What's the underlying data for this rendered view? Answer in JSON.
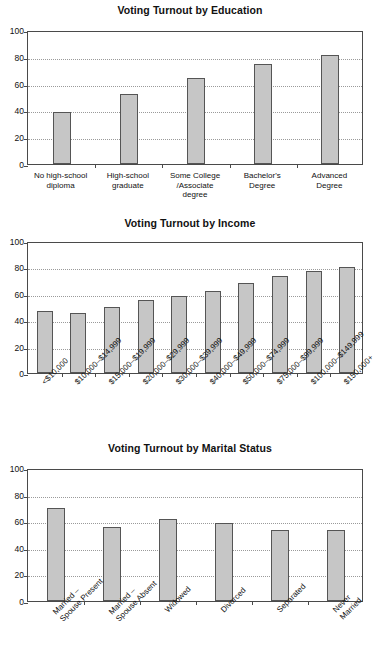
{
  "document": {
    "kind": "statistical-figure-sheet",
    "background_color": "#ffffff"
  },
  "style": {
    "bar_fill": "#c6c6c6",
    "bar_stroke": "#555555",
    "axis_color": "#4a4a4a",
    "grid_color": "#9a9a9a",
    "text_color": "#111111"
  },
  "charts": [
    {
      "id": "education",
      "title": "Voting Turnout by Education",
      "y_ticks": [
        "0",
        "20",
        "40",
        "60",
        "80",
        "100"
      ],
      "categories": [
        "No high-school\ndiploma",
        "High-school\ngraduate",
        "Some College\n/Associate\ndegree",
        "Bachelor's\nDegree",
        "Advanced\nDegree"
      ],
      "values": [
        38.5,
        52.5,
        64,
        75,
        81.5
      ],
      "label_rotation": 0
    },
    {
      "id": "income",
      "title": "Voting Turnout by Income",
      "y_ticks": [
        "0",
        "20",
        "40",
        "60",
        "80",
        "100"
      ],
      "categories": [
        "<$10,000",
        "$10,000–$14,999",
        "$15,000–$19,999",
        "$20,000–$29,999",
        "$30,000–$39,999",
        "$40,000–$49,999",
        "$50,000–$74,999",
        "$75,000–$99,999",
        "$100,000–$149,999",
        "$150,000+"
      ],
      "values": [
        47,
        45.5,
        50,
        55.5,
        58,
        62.5,
        68,
        73.5,
        77,
        80
      ],
      "label_rotation": -45
    },
    {
      "id": "marital-status",
      "title": "Voting Turnout by Marital Status",
      "y_ticks": [
        "0",
        "20",
        "40",
        "60",
        "80",
        "100"
      ],
      "categories": [
        "Married –\nSpouse Present",
        "Married –\nSpouse Absent",
        "Widowed",
        "Divorced",
        "Separated",
        "Never Married"
      ],
      "values": [
        70,
        56,
        61.5,
        59,
        53.5,
        53.5
      ],
      "label_rotation": -45
    }
  ],
  "chart_data": [
    {
      "type": "bar",
      "title": "Voting Turnout by Education",
      "xlabel": "",
      "ylabel": "",
      "ylim": [
        0,
        100
      ],
      "grid": true,
      "legend": "none",
      "categories": [
        "No high-school diploma",
        "High-school graduate",
        "Some College/Associate degree",
        "Bachelor's Degree",
        "Advanced Degree"
      ],
      "values": [
        38.5,
        52.5,
        64,
        75,
        81.5
      ],
      "ytick_labels": [
        "0",
        "20",
        "40",
        "60",
        "80",
        "100"
      ]
    },
    {
      "type": "bar",
      "title": "Voting Turnout by Income",
      "xlabel": "",
      "ylabel": "",
      "ylim": [
        0,
        100
      ],
      "grid": true,
      "legend": "none",
      "categories": [
        "<$10,000",
        "$10,000–$14,999",
        "$15,000–$19,999",
        "$20,000–$29,999",
        "$30,000–$39,999",
        "$40,000–$49,999",
        "$50,000–$74,999",
        "$75,000–$99,999",
        "$100,000–$149,999",
        "$150,000+"
      ],
      "values": [
        47,
        45.5,
        50,
        55.5,
        58,
        62.5,
        68,
        73.5,
        77,
        80
      ],
      "ytick_labels": [
        "0",
        "20",
        "40",
        "60",
        "80",
        "100"
      ]
    },
    {
      "type": "bar",
      "title": "Voting Turnout by Marital Status",
      "xlabel": "",
      "ylabel": "",
      "ylim": [
        0,
        100
      ],
      "grid": true,
      "legend": "none",
      "categories": [
        "Married – Spouse Present",
        "Married – Spouse Absent",
        "Widowed",
        "Divorced",
        "Separated",
        "Never Married"
      ],
      "values": [
        70,
        56,
        61.5,
        59,
        53.5,
        53.5
      ],
      "ytick_labels": [
        "0",
        "20",
        "40",
        "60",
        "80",
        "100"
      ]
    }
  ]
}
